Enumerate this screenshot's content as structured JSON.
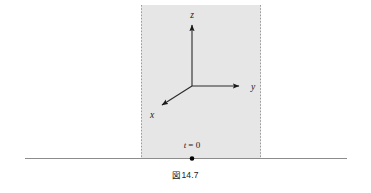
{
  "figure": {
    "caption_prefix": "図",
    "caption_number": "14.7",
    "background_color": "#ffffff",
    "slab": {
      "fill_color": "#e6e6e6",
      "border_style": "dashed",
      "border_color": "#9a9a9a",
      "x": 141,
      "y": 5,
      "width": 120,
      "height": 153
    },
    "ground_line": {
      "color": "#8c8c8c",
      "x1": 25,
      "x2": 347,
      "y": 158
    },
    "origin_point": {
      "label": "t = 0",
      "label_var": "t",
      "label_eq": "= 0",
      "dot_color": "#000000",
      "dot_x": 192,
      "dot_y": 158
    },
    "axes": {
      "origin_x": 192,
      "origin_y": 86,
      "color": "#2a2a2a",
      "items": [
        {
          "name": "z",
          "label": "z",
          "tip_x": 192,
          "tip_y": 21,
          "label_x": 192,
          "label_y": 15
        },
        {
          "name": "y",
          "label": "y",
          "tip_x": 243,
          "tip_y": 86,
          "label_x": 252,
          "label_y": 89
        },
        {
          "name": "x",
          "label": "x",
          "tip_x": 159,
          "tip_y": 108,
          "label_x": 152,
          "label_y": 117
        }
      ]
    }
  }
}
